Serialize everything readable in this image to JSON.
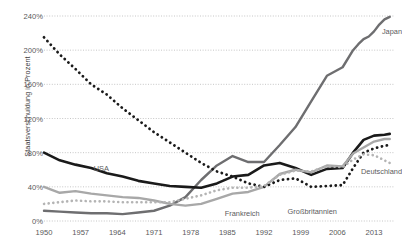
{
  "chart_data": {
    "type": "line",
    "title": "",
    "xlabel": "",
    "ylabel": "Staatsverschuldung in Prozent",
    "xlim": [
      1950,
      2017
    ],
    "ylim": [
      0,
      240
    ],
    "grid": true,
    "legend_position": "inline-end-of-line",
    "xticks": [
      "1950",
      "1957",
      "1964",
      "1971",
      "1978",
      "1985",
      "1992",
      "1999",
      "2006",
      "2013"
    ],
    "xtick_values": [
      1950,
      1957,
      1964,
      1971,
      1978,
      1985,
      1992,
      1999,
      2006,
      2013
    ],
    "yticks": [
      "0%",
      "40%",
      "80%",
      "120%",
      "160%",
      "200%",
      "240%"
    ],
    "ytick_values": [
      0,
      40,
      80,
      120,
      160,
      200,
      240
    ],
    "series": [
      {
        "name": "Japan",
        "color": "#6e6e70",
        "style": "solid",
        "width": 2.4,
        "label_x": 2014.5,
        "label_y": 222,
        "x": [
          1950,
          1953,
          1956,
          1959,
          1962,
          1965,
          1968,
          1971,
          1974,
          1977,
          1980,
          1983,
          1986,
          1989,
          1992,
          1995,
          1998,
          2001,
          2004,
          2007,
          2009,
          2010,
          2011,
          2012,
          2013,
          2014,
          2015,
          2016
        ],
        "values": [
          12,
          11,
          10,
          9,
          9,
          8,
          10,
          12,
          18,
          28,
          48,
          65,
          76,
          69,
          69,
          89,
          110,
          140,
          170,
          180,
          200,
          207,
          213,
          216,
          222,
          230,
          236,
          239
        ]
      },
      {
        "name": "USA",
        "color": "#1a1a1a",
        "style": "solid",
        "width": 2.6,
        "label_x": 1959.5,
        "label_y": 62,
        "x": [
          1950,
          1953,
          1956,
          1959,
          1962,
          1965,
          1968,
          1971,
          1974,
          1977,
          1980,
          1983,
          1986,
          1989,
          1992,
          1995,
          1998,
          2001,
          2004,
          2007,
          2009,
          2011,
          2013,
          2015,
          2016
        ],
        "values": [
          80,
          71,
          66,
          62,
          56,
          52,
          47,
          44,
          41,
          40,
          39,
          44,
          52,
          54,
          65,
          68,
          62,
          54,
          61,
          62,
          80,
          95,
          100,
          101,
          102
        ]
      },
      {
        "name": "Frankreich",
        "color": "#a8a8a8",
        "style": "solid",
        "width": 2.4,
        "label_x": 1984.5,
        "label_y": 9,
        "x": [
          1950,
          1953,
          1956,
          1959,
          1962,
          1965,
          1968,
          1971,
          1974,
          1977,
          1980,
          1983,
          1986,
          1989,
          1992,
          1995,
          1998,
          2001,
          2004,
          2007,
          2009,
          2011,
          2013,
          2015,
          2016
        ],
        "values": [
          40,
          33,
          35,
          32,
          30,
          28,
          27,
          24,
          20,
          18,
          20,
          26,
          32,
          34,
          40,
          55,
          60,
          57,
          65,
          64,
          79,
          86,
          93,
          96,
          96
        ]
      },
      {
        "name": "Großbritannien",
        "color": "#1a1a1a",
        "style": "dotted",
        "width": 2.8,
        "label_x": 1996.5,
        "label_y": 12,
        "x": [
          1950,
          1953,
          1956,
          1959,
          1962,
          1965,
          1968,
          1971,
          1974,
          1977,
          1980,
          1983,
          1986,
          1989,
          1992,
          1995,
          1998,
          2001,
          2004,
          2007,
          2009,
          2011,
          2013,
          2015,
          2016
        ],
        "values": [
          215,
          195,
          178,
          160,
          148,
          132,
          118,
          104,
          92,
          80,
          68,
          58,
          52,
          44,
          40,
          48,
          50,
          40,
          41,
          42,
          62,
          80,
          85,
          88,
          89
        ]
      },
      {
        "name": "Deutschland",
        "color": "#b4b4b4",
        "style": "dotted",
        "width": 2.6,
        "label_x": 2010.5,
        "label_y": 58,
        "x": [
          1950,
          1953,
          1956,
          1959,
          1962,
          1965,
          1968,
          1971,
          1974,
          1977,
          1980,
          1983,
          1986,
          1989,
          1992,
          1995,
          1998,
          2001,
          2004,
          2007,
          2009,
          2011,
          2013,
          2015,
          2016
        ],
        "values": [
          20,
          22,
          24,
          23,
          23,
          22,
          22,
          22,
          22,
          26,
          30,
          36,
          39,
          39,
          41,
          54,
          59,
          58,
          64,
          63,
          72,
          78,
          77,
          71,
          68
        ]
      }
    ]
  },
  "axis": {
    "y_title": "Staatsverschuldung in Prozent"
  }
}
